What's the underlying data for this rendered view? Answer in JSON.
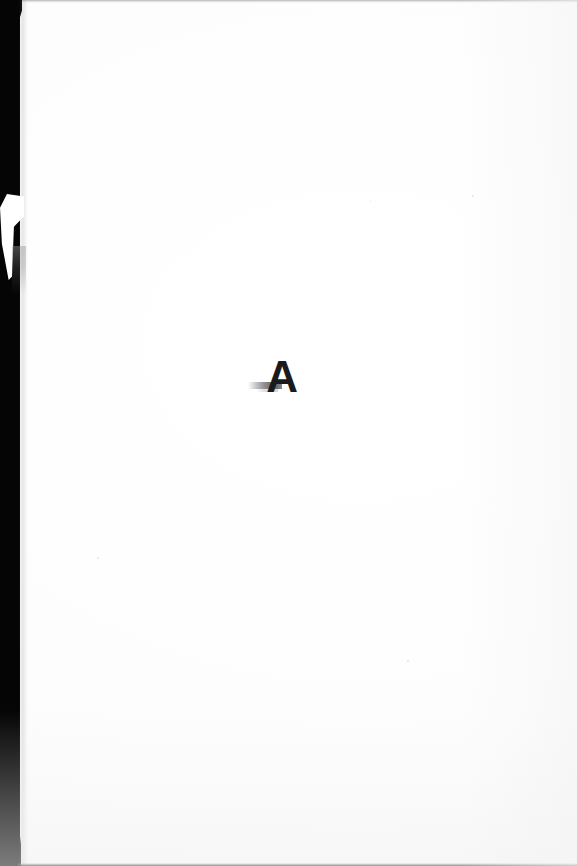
{
  "page": {
    "kind": "scanned-document-page",
    "content_description": "Blank scanned page with a single handwritten ink mark near the center",
    "background_color": "#ffffff",
    "width_px": 577,
    "height_px": 866
  },
  "ink_mark": {
    "glyph": "A",
    "label": "handwritten letter A",
    "color": "#1a1a1c",
    "smudge_label": "faint horizontal ink smudge"
  },
  "scan_edges": {
    "left_band": {
      "label": "left scanner edge band",
      "color": "#050505"
    },
    "left_notch": {
      "label": "white wedge notch in scanner edge",
      "color": "#ffffff"
    },
    "top_line": {
      "label": "top scan edge line",
      "color": "#78787a"
    },
    "bottom_line": {
      "label": "bottom scan edge line",
      "color": "#232326"
    }
  },
  "body_text": ""
}
